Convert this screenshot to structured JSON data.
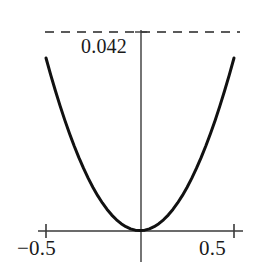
{
  "figure": {
    "background_color": "#ffffff",
    "curve_color": "#111111",
    "axis_color": "#3a3a3a",
    "dashed_line_color": "#5a5a5a",
    "text_color": "#1a1a1a"
  },
  "labels": {
    "x_min": "−0.5",
    "x_max": "0.5",
    "y_max": "0.042"
  },
  "chart_data": {
    "type": "line",
    "title": "",
    "subtitle": "",
    "xlabel": "",
    "ylabel": "",
    "xlim": [
      -0.5,
      0.5
    ],
    "ylim": [
      0,
      0.042
    ],
    "grid": false,
    "legend": null,
    "legend_position": "none",
    "xticks": [
      -0.5,
      0.5
    ],
    "xticklabels": [
      "−0.5",
      "0.5"
    ],
    "yticks": [
      0.042
    ],
    "yticklabels": [
      "0.042"
    ],
    "annotations": [
      {
        "type": "dashed-horizontal-line",
        "y": 0.042,
        "label": "0.042",
        "color": "#5a5a5a",
        "style": "dashed"
      }
    ],
    "series": [
      {
        "name": "parabola",
        "color": "#111111",
        "line_width": 3,
        "x": [
          -0.5,
          -0.475,
          -0.45,
          -0.425,
          -0.4,
          -0.375,
          -0.35,
          -0.325,
          -0.3,
          -0.275,
          -0.25,
          -0.225,
          -0.2,
          -0.175,
          -0.15,
          -0.125,
          -0.1,
          -0.075,
          -0.05,
          -0.025,
          0.0,
          0.025,
          0.05,
          0.075,
          0.1,
          0.125,
          0.15,
          0.175,
          0.2,
          0.225,
          0.25,
          0.275,
          0.3,
          0.325,
          0.35,
          0.375,
          0.4,
          0.425,
          0.45,
          0.475,
          0.5
        ],
        "y": [
          0.042,
          0.037905,
          0.03402,
          0.030345,
          0.02688,
          0.023625,
          0.02058,
          0.017745,
          0.01512,
          0.012705,
          0.0105,
          0.008505,
          0.00672,
          0.005145,
          0.00378,
          0.002625,
          0.00168,
          0.000945,
          0.00042,
          0.000105,
          0.0,
          0.000105,
          0.00042,
          0.000945,
          0.00168,
          0.002625,
          0.00378,
          0.005145,
          0.00672,
          0.008505,
          0.0105,
          0.012705,
          0.01512,
          0.017745,
          0.02058,
          0.023625,
          0.02688,
          0.030345,
          0.03402,
          0.037905,
          0.042
        ]
      }
    ]
  }
}
